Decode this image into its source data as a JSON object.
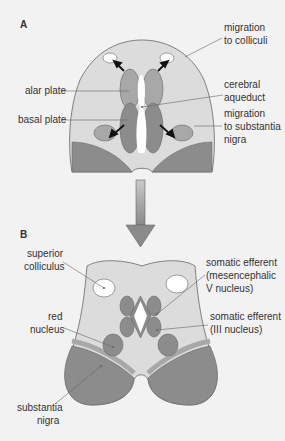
{
  "panel_a": {
    "label": "A",
    "labels": {
      "migration_colliculi": [
        "migration",
        "to colliculi"
      ],
      "alar_plate": "alar plate",
      "basal_plate": "basal plate",
      "cerebral_aqueduct": [
        "cerebral",
        "aqueduct"
      ],
      "migration_substantia": [
        "migration",
        "to substantia",
        "nigra"
      ]
    }
  },
  "panel_b": {
    "label": "B",
    "labels": {
      "superior_colliculus": [
        "superior",
        "colliculus"
      ],
      "somatic_efferent_v": [
        "somatic efferent",
        "(mesencephalic",
        "V nucleus)"
      ],
      "somatic_efferent_iii": [
        "somatic efferent",
        "(III nucleus)"
      ],
      "red_nucleus": [
        "red",
        "nucleus"
      ],
      "substantia_nigra": [
        "substantia",
        "nigra"
      ]
    }
  },
  "colors": {
    "background": "#f2f2f2",
    "tissue_light": "#dcdcdc",
    "plate_mid": "#a8a8a8",
    "plate_dark": "#8c8c8c",
    "outline": "#666666"
  }
}
